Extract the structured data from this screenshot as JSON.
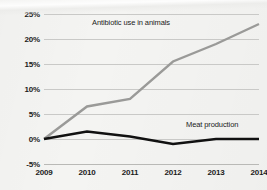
{
  "chart_data": {
    "type": "line",
    "title": "",
    "subtitle": "",
    "xlabel": "",
    "ylabel": "",
    "categories": [
      "2009",
      "2010",
      "2011",
      "2012",
      "2013",
      "2014"
    ],
    "x": [
      2009,
      2010,
      2011,
      2012,
      2013,
      2014
    ],
    "ylim": [
      -5,
      25
    ],
    "ytick_values": [
      25,
      20,
      15,
      10,
      5,
      0,
      -5
    ],
    "ytick_labels": [
      "25%",
      "20%",
      "15%",
      "10%",
      "5%",
      "0%",
      "-5%"
    ],
    "grid": true,
    "grid_axis": "y",
    "legend": "inline-labels",
    "series": [
      {
        "name": "Antibiotic use in animals",
        "color": "#9a9a98",
        "values": [
          0,
          6.5,
          8,
          15.5,
          19,
          23
        ],
        "label_text": "Antibiotic use in animals"
      },
      {
        "name": "Meat production",
        "color": "#111111",
        "values": [
          0,
          1.5,
          0.5,
          -1,
          0,
          0
        ],
        "label_text": "Meat production"
      }
    ]
  },
  "axes": {
    "y_labels": [
      "25%",
      "20%",
      "15%",
      "10%",
      "5%",
      "0%",
      "-5%"
    ],
    "x_labels": [
      "2009",
      "2010",
      "2011",
      "2012",
      "2013",
      "2014"
    ]
  },
  "colors": {
    "background": "#f4f4f2",
    "gridline": "#c9c9c7",
    "series_grey": "#9a9a98",
    "series_black": "#111111",
    "text": "#1b1b1b"
  }
}
